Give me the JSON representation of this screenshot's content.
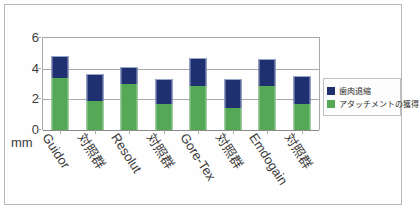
{
  "chart_data": {
    "type": "bar",
    "stacked": true,
    "title": "",
    "subtitle": "",
    "xlabel": "",
    "ylabel": "mm",
    "ylim": [
      0,
      6
    ],
    "yticks": [
      "0",
      "2",
      "4",
      "6"
    ],
    "grid": true,
    "legend_position": "right",
    "categories": [
      "Guidor",
      "対照群",
      "Resolut",
      "対照群",
      "Gore-Tex",
      "対照群",
      "Emdogain",
      "対照群"
    ],
    "series": [
      {
        "name": "アタッチメントの獲得",
        "color": "#55a855",
        "values": [
          3.4,
          1.9,
          3.0,
          1.7,
          2.85,
          1.45,
          2.85,
          1.7
        ]
      },
      {
        "name": "歯肉退縮",
        "color": "#1f3070",
        "values": [
          1.4,
          1.75,
          1.1,
          1.65,
          1.85,
          1.85,
          1.75,
          1.8
        ]
      }
    ],
    "totals": [
      4.8,
      3.65,
      4.1,
      3.35,
      4.7,
      3.3,
      4.6,
      3.5
    ]
  },
  "legend": {
    "entries": [
      {
        "label": "歯肉退縮",
        "color": "#1f3070"
      },
      {
        "label": "アタッチメントの獲得",
        "color": "#55a855"
      }
    ]
  },
  "axis": {
    "unit": "mm"
  }
}
